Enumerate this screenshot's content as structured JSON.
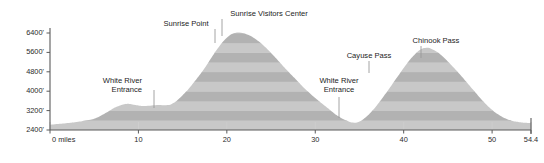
{
  "chart_data": {
    "type": "area",
    "title": "",
    "subtitle": "",
    "xlabel": "",
    "ylabel": "",
    "grid": false,
    "legend_position": "none",
    "xlim": [
      0,
      54.4
    ],
    "ylim": [
      2400,
      6700
    ],
    "x_ticks": [
      0,
      10,
      20,
      30,
      40,
      50,
      54.4
    ],
    "x_tick_labels": [
      "0 miles",
      "10",
      "20",
      "30",
      "40",
      "50",
      "54.4"
    ],
    "y_ticks": [
      2400,
      3200,
      4000,
      4800,
      5600,
      6400
    ],
    "y_tick_labels": [
      "2400'",
      "3200'",
      "4000'",
      "4800'",
      "5600'",
      "6400'"
    ],
    "band_interval": 400,
    "band_color_light": "#c8c8c8",
    "band_color_dark": "#b2b2b2",
    "x": [
      0.0,
      1.2,
      2.4,
      3.6,
      4.8,
      5.6,
      6.4,
      7.2,
      8.0,
      8.8,
      9.6,
      10.4,
      11.2,
      11.8,
      12.4,
      13.0,
      13.6,
      14.2,
      14.8,
      15.6,
      16.4,
      17.2,
      18.0,
      18.8,
      19.6,
      20.4,
      21.2,
      22.0,
      22.8,
      23.6,
      24.4,
      25.2,
      26.0,
      26.8,
      27.6,
      28.4,
      29.2,
      30.0,
      30.8,
      31.6,
      32.4,
      33.2,
      34.0,
      34.6,
      35.2,
      36.0,
      36.8,
      37.6,
      38.4,
      39.2,
      40.0,
      40.8,
      41.6,
      42.2,
      42.8,
      43.4,
      44.0,
      44.8,
      45.6,
      46.4,
      47.2,
      48.0,
      48.8,
      49.6,
      50.4,
      51.2,
      52.0,
      52.8,
      53.6,
      54.4
    ],
    "y": [
      2620,
      2660,
      2700,
      2760,
      2840,
      2960,
      3120,
      3300,
      3420,
      3480,
      3430,
      3390,
      3400,
      3420,
      3430,
      3420,
      3440,
      3560,
      3760,
      4060,
      4420,
      4800,
      5240,
      5680,
      6060,
      6330,
      6420,
      6380,
      6260,
      6060,
      5800,
      5500,
      5180,
      4860,
      4560,
      4260,
      3980,
      3720,
      3480,
      3250,
      3020,
      2840,
      2720,
      2700,
      2780,
      3020,
      3340,
      3720,
      4120,
      4540,
      4960,
      5340,
      5640,
      5770,
      5790,
      5700,
      5560,
      5300,
      5000,
      4680,
      4340,
      4000,
      3660,
      3360,
      3110,
      2930,
      2810,
      2740,
      2700,
      2690
    ],
    "annotations": [
      {
        "label": "White River\nEntrance",
        "lines": [
          "White River",
          "Entrance"
        ],
        "x": 8.6,
        "y": 3470,
        "align": "end",
        "label_x": 142,
        "label_y": 83,
        "leader_x": 154,
        "leader_y1": 90,
        "leader_y2": 108
      },
      {
        "label": "Sunrise Point",
        "lines": [
          "Sunrise Point"
        ],
        "x": 20.4,
        "y": 6340,
        "align": "middle",
        "label_x": 186,
        "label_y": 26,
        "leader_x": 215,
        "leader_y1": 29,
        "leader_y2": 43
      },
      {
        "label": "Sunrise Visitors Center",
        "lines": [
          "Sunrise Visitors Center"
        ],
        "x": 22.6,
        "y": 6300,
        "align": "middle",
        "label_x": 269,
        "label_y": 16,
        "leader_x": 222,
        "leader_y1": 19,
        "leader_y2": 36
      },
      {
        "label": "White River\nEntrance",
        "lines": [
          "White River",
          "Entrance"
        ],
        "x": 34.6,
        "y": 2700,
        "align": "middle",
        "label_x": 339,
        "label_y": 83,
        "leader_x": 339,
        "leader_y1": 97,
        "leader_y2": 118
      },
      {
        "label": "Cayuse Pass",
        "lines": [
          "Cayuse Pass"
        ],
        "x": 41.0,
        "y": 5460,
        "align": "middle",
        "label_x": 369,
        "label_y": 58,
        "leader_x": 369,
        "leader_y1": 61,
        "leader_y2": 73
      },
      {
        "label": "Chinook Pass",
        "lines": [
          "Chinook Pass"
        ],
        "x": 42.5,
        "y": 5790,
        "align": "middle",
        "label_x": 436,
        "label_y": 43,
        "leader_x": 421,
        "leader_y1": 46,
        "leader_y2": 58
      }
    ]
  },
  "colors": {
    "axis": "#5a5a5a",
    "text": "#1c1c1c",
    "leader": "#9a9a9a",
    "background": "#ffffff"
  }
}
